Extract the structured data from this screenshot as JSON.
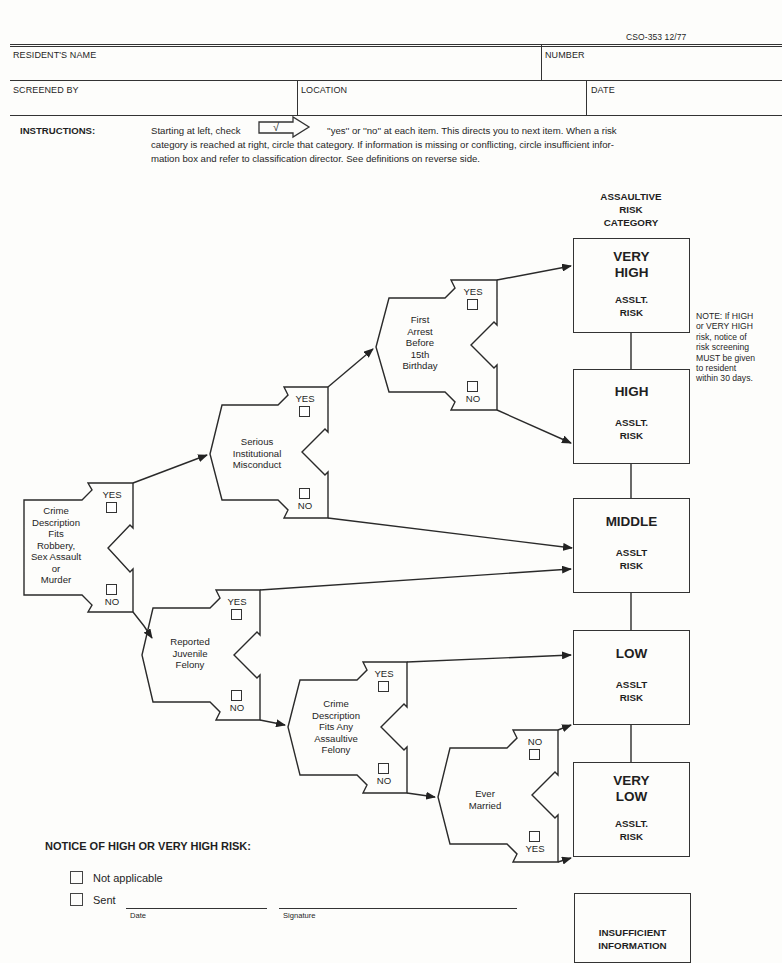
{
  "form_id": "CSO-353 12/77",
  "header_fields": {
    "resident_name_label": "RESIDENT'S NAME",
    "resident_name_value": "",
    "number_label": "NUMBER",
    "number_value": "",
    "screened_by_label": "SCREENED BY",
    "screened_by_value": "",
    "location_label": "LOCATION",
    "location_value": "",
    "date_label": "DATE",
    "date_value": ""
  },
  "instructions": {
    "label": "INSTRUCTIONS:",
    "before_check": "Starting at left, check",
    "check_glyph": "√",
    "line1_rest": "''yes'' or ''no'' at each item. This directs you to next item. When a risk",
    "line2": "category is reached at right, circle that category. If information is missing or conflicting, circle insufficient infor-",
    "line3": "mation box and refer to classification director. See definitions on reverse side."
  },
  "category_header": [
    "ASSAULTIVE",
    "RISK",
    "CATEGORY"
  ],
  "decision_nodes": [
    {
      "id": "crime_desc",
      "lines": [
        "Crime",
        "Description",
        "Fits",
        "Robbery,",
        "Sex Assault",
        "or",
        "Murder"
      ],
      "top_option": "YES",
      "bottom_option": "NO"
    },
    {
      "id": "serious_misconduct",
      "lines": [
        "Serious",
        "Institutional",
        "Misconduct"
      ],
      "top_option": "YES",
      "bottom_option": "NO"
    },
    {
      "id": "first_arrest",
      "lines": [
        "First",
        "Arrest",
        "Before",
        "15th",
        "Birthday"
      ],
      "top_option": "YES",
      "bottom_option": "NO"
    },
    {
      "id": "juvenile_felony",
      "lines": [
        "Reported",
        "Juvenile",
        "Felony"
      ],
      "top_option": "YES",
      "bottom_option": "NO"
    },
    {
      "id": "assaultive_felony",
      "lines": [
        "Crime",
        "Description",
        "Fits Any",
        "Assaultive",
        "Felony"
      ],
      "top_option": "YES",
      "bottom_option": "NO"
    },
    {
      "id": "ever_married",
      "lines": [
        "Ever",
        "Married"
      ],
      "top_option": "NO",
      "bottom_option": "YES"
    }
  ],
  "risk_categories": [
    {
      "title": [
        "VERY",
        "HIGH"
      ],
      "sub": [
        "ASSLT.",
        "RISK"
      ]
    },
    {
      "title": [
        "HIGH"
      ],
      "sub": [
        "ASSLT.",
        "RISK"
      ]
    },
    {
      "title": [
        "MIDDLE"
      ],
      "sub": [
        "ASSLT",
        "RISK"
      ]
    },
    {
      "title": [
        "LOW"
      ],
      "sub": [
        "ASSLT",
        "RISK"
      ]
    },
    {
      "title": [
        "VERY",
        "LOW"
      ],
      "sub": [
        "ASSLT.",
        "RISK"
      ]
    },
    {
      "title": [
        "INSUFFICIENT",
        "INFORMATION"
      ],
      "sub": []
    }
  ],
  "note": [
    "NOTE: If HIGH",
    "or VERY HIGH",
    "risk, notice of",
    "risk screening",
    "MUST be given",
    "to resident",
    "within 30 days."
  ],
  "notice": {
    "title": "NOTICE OF HIGH OR VERY HIGH RISK:",
    "not_applicable_label": "Not applicable",
    "sent_label": "Sent",
    "date_caption": "Date",
    "signature_caption": "Signature"
  }
}
